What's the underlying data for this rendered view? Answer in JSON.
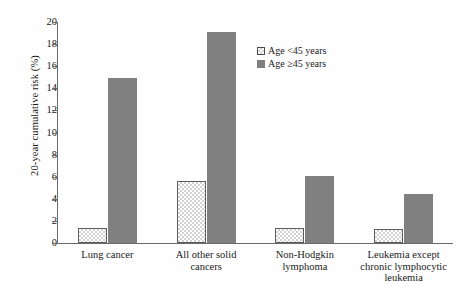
{
  "chart_data": {
    "type": "bar",
    "title": "",
    "xlabel": "",
    "ylabel": "20-year cumulative risk (%)",
    "ylim": [
      0,
      20
    ],
    "yticks": [
      "0",
      "2",
      "4",
      "6",
      "8",
      "10",
      "12",
      "14",
      "16",
      "18",
      "20"
    ],
    "grid": false,
    "legend_position": "top-right",
    "categories": [
      "Lung cancer",
      "All other solid cancers",
      "Non-Hodgkin lymphoma",
      "Leukemia except chronic lymphocytic leukemia"
    ],
    "category_lines": [
      [
        "Lung cancer"
      ],
      [
        "All other solid",
        "cancers"
      ],
      [
        "Non-Hodgkin",
        "lymphoma"
      ],
      [
        "Leukemia except",
        "chronic lymphocytic",
        "leukemia"
      ]
    ],
    "series": [
      {
        "name": "Age <45 years",
        "color": "#d2d2d2",
        "pattern": "checker",
        "values": [
          1.4,
          5.6,
          1.4,
          1.3
        ]
      },
      {
        "name": "Age ≥45 years",
        "color": "#808080",
        "pattern": "solid",
        "values": [
          14.9,
          19.1,
          6.1,
          4.4
        ]
      }
    ]
  },
  "legend": {
    "items": [
      {
        "label": "Age <45 years",
        "swatch": "light"
      },
      {
        "label": "Age ≥45 years",
        "swatch": "dark"
      }
    ]
  },
  "axes": {
    "y_title": "20-year cumulative risk (%)"
  }
}
